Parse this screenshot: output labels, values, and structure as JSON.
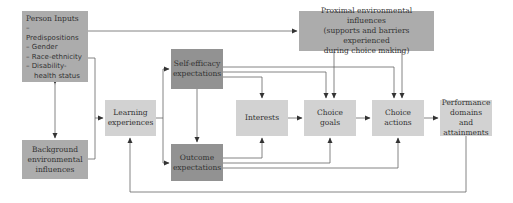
{
  "diagram": {
    "nodes": {
      "person_inputs": {
        "label": "Person Inputs",
        "items": [
          "– Predispositions",
          "– Gender",
          "– Race-ethnicity",
          "– Disability-",
          "health status"
        ]
      },
      "background": {
        "label": "Background environmental influences",
        "lines": [
          "Background",
          "environmental",
          "influences"
        ]
      },
      "learning": {
        "label": "Learning experiences",
        "lines": [
          "Learning",
          "experiences"
        ]
      },
      "self_efficacy": {
        "label": "Self-efficacy expectations",
        "lines": [
          "Self-efficacy",
          "expectations"
        ]
      },
      "outcome": {
        "label": "Outcome expectations",
        "lines": [
          "Outcome",
          "expectations"
        ]
      },
      "interests": {
        "label": "Interests",
        "lines": [
          "Interests"
        ]
      },
      "choice_goals": {
        "label": "Choice goals",
        "lines": [
          "Choice goals"
        ]
      },
      "choice_actions": {
        "label": "Choice actions",
        "lines": [
          "Choice",
          "actions"
        ]
      },
      "performance": {
        "label": "Performance domains and attainments",
        "lines": [
          "Performance",
          "domains and",
          "attainments"
        ]
      },
      "proximal": {
        "label": "Proximal environmental influences (supports and barriers experienced during choice making)",
        "lines": [
          "Proximal environmental influences",
          "(supports and barriers experienced",
          "during choice making)"
        ]
      }
    },
    "edges": [
      {
        "from": "person_inputs",
        "to": "background",
        "bidirectional": true
      },
      {
        "from": "person_inputs",
        "to": "learning"
      },
      {
        "from": "background",
        "to": "learning"
      },
      {
        "from": "person_inputs",
        "to": "proximal"
      },
      {
        "from": "learning",
        "to": "self_efficacy"
      },
      {
        "from": "learning",
        "to": "outcome"
      },
      {
        "from": "self_efficacy",
        "to": "outcome"
      },
      {
        "from": "self_efficacy",
        "to": "interests"
      },
      {
        "from": "self_efficacy",
        "to": "choice_goals"
      },
      {
        "from": "self_efficacy",
        "to": "choice_actions"
      },
      {
        "from": "outcome",
        "to": "interests"
      },
      {
        "from": "outcome",
        "to": "choice_goals"
      },
      {
        "from": "outcome",
        "to": "choice_actions"
      },
      {
        "from": "interests",
        "to": "choice_goals"
      },
      {
        "from": "choice_goals",
        "to": "choice_actions"
      },
      {
        "from": "choice_actions",
        "to": "performance"
      },
      {
        "from": "proximal",
        "to": "choice_goals"
      },
      {
        "from": "proximal",
        "to": "choice_actions"
      },
      {
        "from": "performance",
        "to": "learning"
      }
    ],
    "colors": {
      "mid": "#acacac",
      "dark": "#929292",
      "light": "#d2d2d2",
      "line": "#555555"
    }
  }
}
